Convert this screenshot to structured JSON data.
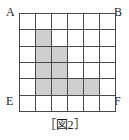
{
  "figure": {
    "caption": "［図2］",
    "corner_labels": {
      "top_left": "A",
      "top_right": "B",
      "bottom_left": "E",
      "bottom_right": "F"
    },
    "colors": {
      "shaded_cell": "#cfcfcf",
      "empty_cell": "#ffffff",
      "grid_line": "#4a4a4a",
      "border": "#3b3b3b",
      "text": "#1a1a1a",
      "background": "#ffffff"
    }
  },
  "chart_data": {
    "type": "heatmap",
    "title": "［図2］",
    "xlabel": "",
    "ylabel": "",
    "rows": 6,
    "cols": 6,
    "grid": [
      [
        0,
        0,
        0,
        0,
        0,
        0
      ],
      [
        0,
        1,
        0,
        0,
        0,
        0
      ],
      [
        0,
        1,
        1,
        0,
        0,
        0
      ],
      [
        0,
        1,
        1,
        0,
        0,
        0
      ],
      [
        0,
        1,
        1,
        1,
        1,
        0
      ],
      [
        0,
        0,
        0,
        0,
        0,
        0
      ]
    ],
    "shaded_cells": [
      {
        "row": 2,
        "col": 2
      },
      {
        "row": 3,
        "col": 2
      },
      {
        "row": 3,
        "col": 3
      },
      {
        "row": 4,
        "col": 2
      },
      {
        "row": 4,
        "col": 3
      },
      {
        "row": 5,
        "col": 2
      },
      {
        "row": 5,
        "col": 3
      },
      {
        "row": 5,
        "col": 4
      },
      {
        "row": 5,
        "col": 5
      }
    ],
    "shaded_count": 9,
    "total_cells": 36,
    "legend": [
      {
        "label": "shaded",
        "value": 1,
        "color": "#cfcfcf"
      },
      {
        "label": "empty",
        "value": 0,
        "color": "#ffffff"
      }
    ],
    "annotations": [
      {
        "text": "A",
        "position": "top-left"
      },
      {
        "text": "B",
        "position": "top-right"
      },
      {
        "text": "E",
        "position": "bottom-left"
      },
      {
        "text": "F",
        "position": "bottom-right"
      }
    ],
    "grid_visible": true
  }
}
